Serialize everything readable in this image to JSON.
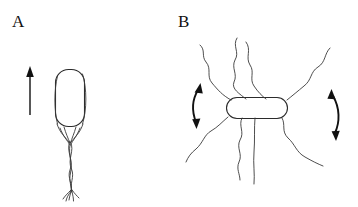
{
  "figure": {
    "width": 358,
    "height": 207,
    "background_color": "#ffffff",
    "ink_color": "#2b2b2b",
    "arrow_color": "#111111"
  },
  "panels": [
    {
      "id": "a",
      "label": "A",
      "label_position": {
        "x": 12,
        "y": 13
      },
      "state": "run",
      "cell_body": {
        "shape": "capsule-vertical",
        "x": 55,
        "y": 69,
        "width": 30,
        "height": 58,
        "corner_radius": 13
      },
      "flagella": {
        "arrangement": "bundled",
        "count": 4,
        "bundle_origin": {
          "x": 69,
          "y": 127
        },
        "bundle_tip": {
          "x": 72,
          "y": 192
        },
        "description": "flagella converge below the cell pole into a single twisted helical bundle that frays at the distal tip"
      },
      "direction_arrow": {
        "type": "straight-single-head",
        "orientation": "up",
        "x": 30,
        "y_tip": 67,
        "y_tail": 115
      }
    },
    {
      "id": "b",
      "label": "B",
      "label_position": {
        "x": 178,
        "y": 13
      },
      "state": "tumble",
      "cell_body": {
        "shape": "capsule-horizontal",
        "x": 226,
        "y": 97,
        "width": 62,
        "height": 22,
        "corner_radius": 11
      },
      "flagella": {
        "arrangement": "splayed",
        "count": 7,
        "description": "wavy flagellar filaments radiate independently from the cell in all directions"
      },
      "rotation_arrows": [
        {
          "side": "left",
          "type": "curved-double-head",
          "bow": "left",
          "x": 196,
          "y_top": 83,
          "y_bottom": 128
        },
        {
          "side": "right",
          "type": "curved-double-head",
          "bow": "right",
          "x": 334,
          "y_top": 88,
          "y_bottom": 140
        }
      ]
    }
  ]
}
